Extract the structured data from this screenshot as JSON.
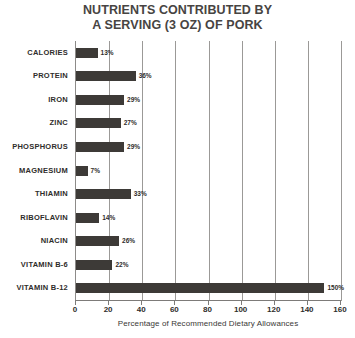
{
  "chart_data": {
    "type": "bar",
    "orientation": "horizontal",
    "title": "NUTRIENTS CONTRIBUTED BY A SERVING (3 OZ) OF PORK",
    "title_line1": "NUTRIENTS CONTRIBUTED BY",
    "title_line2": "A SERVING (3 OZ) OF PORK",
    "xlabel": "Percentage of Recommended Dietary Allowances",
    "ylabel": "",
    "xlim": [
      0,
      160
    ],
    "grid": true,
    "legend": "none",
    "bar_color": "#3d3a37",
    "grid_color": "#9b9997",
    "axis_color": "#7d7b79",
    "xticks": [
      0,
      20,
      40,
      60,
      80,
      100,
      120,
      140,
      160
    ],
    "xtick_labels": [
      "0",
      "20",
      "40",
      "60",
      "80",
      "100",
      "120",
      "140",
      "160"
    ],
    "categories": [
      "CALORIES",
      "PROTEIN",
      "IRON",
      "ZINC",
      "PHOSPHORUS",
      "MAGNESIUM",
      "THIAMIN",
      "RIBOFLAVIN",
      "NIACIN",
      "VITAMIN B-6",
      "VITAMIN B-12"
    ],
    "values": [
      13,
      36,
      29,
      27,
      29,
      7,
      33,
      14,
      26,
      22,
      150
    ],
    "value_labels": [
      "13%",
      "36%",
      "29%",
      "27%",
      "29%",
      "7%",
      "33%",
      "14%",
      "26%",
      "22%",
      "150%"
    ]
  }
}
